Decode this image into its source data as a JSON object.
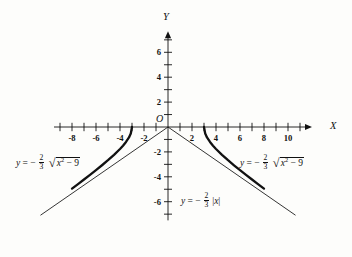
{
  "figure": {
    "background_color": "#fdfdfb",
    "ink_color": "#111111"
  },
  "axes": {
    "x_axis_name": "X",
    "y_axis_name": "Y",
    "origin_label": "O",
    "x_tick_labels": [
      "-8",
      "-6",
      "-4",
      "-2",
      "2",
      "4",
      "6",
      "8",
      "10"
    ],
    "y_tick_labels": [
      "6",
      "4",
      "2",
      "-2",
      "-4",
      "-6"
    ]
  },
  "labels": {
    "left_curve": {
      "lhs": "y",
      "equals": "= −",
      "frac_num": "2",
      "frac_den": "3",
      "radicand_var": "x",
      "radicand_exp": "2",
      "radicand_tail": " − 9"
    },
    "right_curve": {
      "lhs": "y",
      "equals": "= −",
      "frac_num": "2",
      "frac_den": "3",
      "radicand_var": "x",
      "radicand_exp": "2",
      "radicand_tail": " − 9"
    },
    "asymptote": {
      "lhs": "y",
      "equals": "= −",
      "frac_num": "2",
      "frac_den": "3",
      "abs_open": "|",
      "abs_var": "x",
      "abs_close": "|"
    }
  },
  "chart_data": {
    "type": "line",
    "title": "",
    "xlabel": "X",
    "ylabel": "Y",
    "xlim": [
      -9.5,
      11.5
    ],
    "ylim": [
      -7.5,
      7.2
    ],
    "grid": false,
    "legend": "none",
    "x_ticks_major": [
      -8,
      -6,
      -4,
      -2,
      2,
      4,
      6,
      8,
      10
    ],
    "x_ticks_minor": [
      -9,
      -7,
      -5,
      -3,
      -1,
      1,
      3,
      5,
      7,
      9,
      11
    ],
    "y_ticks_major": [
      6,
      4,
      2,
      -2,
      -4,
      -6
    ],
    "y_ticks_minor": [
      7,
      5,
      3,
      1,
      -1,
      -3,
      -5,
      -7
    ],
    "series": [
      {
        "name": "y = -2/3 sqrt(x^2 - 9) (left branch)",
        "style": "thick",
        "domain": [
          -8.0,
          -3.0
        ],
        "points": [
          [
            -8.0,
            -4.944
          ],
          [
            -7.5,
            -4.583
          ],
          [
            -7.0,
            -4.216
          ],
          [
            -6.5,
            -3.844
          ],
          [
            -6.0,
            -3.464
          ],
          [
            -5.5,
            -3.073
          ],
          [
            -5.0,
            -2.667
          ],
          [
            -4.5,
            -2.236
          ],
          [
            -4.0,
            -1.764
          ],
          [
            -3.75,
            -1.5
          ],
          [
            -3.5,
            -1.202
          ],
          [
            -3.25,
            -0.838
          ],
          [
            -3.1,
            -0.516
          ],
          [
            -3.0,
            0.0
          ]
        ]
      },
      {
        "name": "y = -2/3 sqrt(x^2 - 9) (right branch)",
        "style": "thick",
        "domain": [
          3.0,
          8.0
        ],
        "points": [
          [
            3.0,
            0.0
          ],
          [
            3.1,
            -0.516
          ],
          [
            3.25,
            -0.838
          ],
          [
            3.5,
            -1.202
          ],
          [
            3.75,
            -1.5
          ],
          [
            4.0,
            -1.764
          ],
          [
            4.5,
            -2.236
          ],
          [
            5.0,
            -2.667
          ],
          [
            5.5,
            -3.073
          ],
          [
            6.0,
            -3.464
          ],
          [
            6.5,
            -3.844
          ],
          [
            7.0,
            -4.216
          ],
          [
            7.5,
            -4.583
          ],
          [
            8.0,
            -4.944
          ]
        ]
      },
      {
        "name": "y = -2/3 |x| (asymptotes)",
        "style": "thin",
        "points": [
          [
            -10.6,
            -7.07
          ],
          [
            0.0,
            0.0
          ],
          [
            10.6,
            -7.07
          ]
        ]
      }
    ]
  }
}
